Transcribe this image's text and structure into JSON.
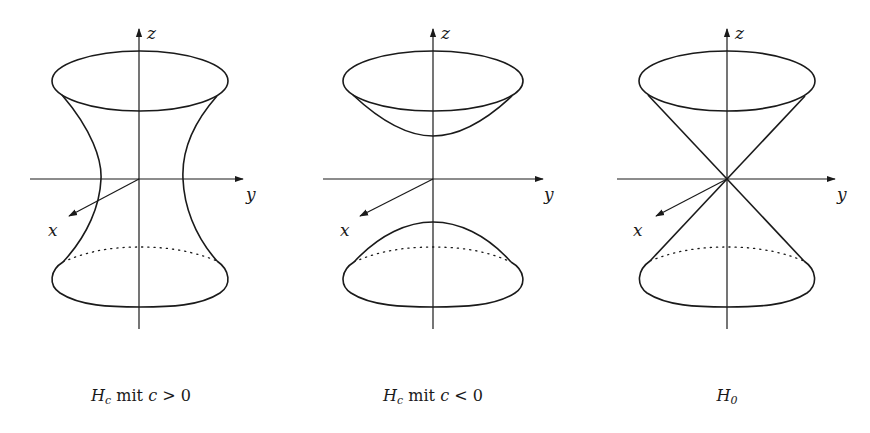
{
  "figure": {
    "panels": [
      {
        "id": "hyperboloid-one-sheet",
        "surface": "one-sheet hyperboloid",
        "origin": [
          139,
          179
        ],
        "axes": {
          "z_label": "z",
          "y_label": "y",
          "x_label": "x"
        },
        "caption": {
          "symbol": "H",
          "subscript": "c",
          "word": "mit",
          "variable": "c",
          "relation": ">",
          "value": "0"
        }
      },
      {
        "id": "hyperboloid-two-sheets",
        "surface": "two-sheet hyperboloid",
        "origin": [
          433,
          179
        ],
        "axes": {
          "z_label": "z",
          "y_label": "y",
          "x_label": "x"
        },
        "caption": {
          "symbol": "H",
          "subscript": "c",
          "word": "mit",
          "variable": "c",
          "relation": "<",
          "value": "0"
        }
      },
      {
        "id": "double-cone",
        "surface": "double cone",
        "origin": [
          727,
          179
        ],
        "axes": {
          "z_label": "z",
          "y_label": "y",
          "x_label": "x"
        },
        "caption": {
          "symbol": "H",
          "subscript": "0",
          "word": "",
          "variable": "",
          "relation": "",
          "value": ""
        }
      }
    ],
    "stroke_color": "#1a1a1a",
    "background": "#ffffff"
  }
}
